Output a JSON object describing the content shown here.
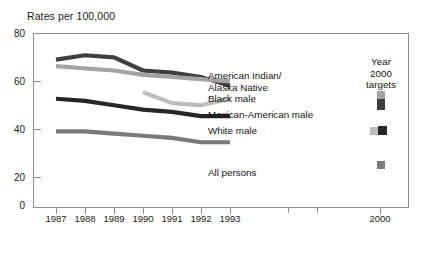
{
  "chart_data": {
    "type": "line",
    "title": "Rates per 100,000",
    "xlabel": "",
    "ylabel": "Rates per 100,000",
    "ylim": [
      0,
      80
    ],
    "yticks": [
      0,
      20,
      40,
      60,
      80
    ],
    "ytick_labels": [
      "0",
      "20",
      "40",
      "60",
      "80"
    ],
    "grid": false,
    "legend_position": "inline-right",
    "x": [
      "1987",
      "1988",
      "1989",
      "1990",
      "1991",
      "1992",
      "1993"
    ],
    "xtick_labels": [
      "1987",
      "1988",
      "1989",
      "1990",
      "1991",
      "1992",
      "1993"
    ],
    "extra_xtick": "2000",
    "series": [
      {
        "name": "American Indian/\nAlaska Native",
        "label_line1": "American Indian/",
        "label_line2": "Alaska Native",
        "color": "#3f3f3f",
        "x": [
          "1987",
          "1988",
          "1989",
          "1990",
          "1991",
          "1992",
          "1993"
        ],
        "values": [
          68,
          70,
          69,
          63,
          62,
          60,
          56
        ],
        "target_2000": 60
      },
      {
        "name": "Black male",
        "label_line1": "Black male",
        "color": "#a3a3a3",
        "x": [
          "1987",
          "1988",
          "1989",
          "1990",
          "1991",
          "1992",
          "1993"
        ],
        "values": [
          65,
          64,
          63,
          61,
          60,
          59,
          58
        ],
        "target_2000": 63
      },
      {
        "name": "Mexican-American male",
        "label_line1": "Mexican-American male",
        "color": "#bdbdbd",
        "x": [
          "1990",
          "1991",
          "1992",
          "1993"
        ],
        "values": [
          53,
          48,
          47,
          50
        ],
        "target_2000": 47
      },
      {
        "name": "White male",
        "label_line1": "White male",
        "color": "#262626",
        "x": [
          "1987",
          "1988",
          "1989",
          "1990",
          "1991",
          "1992",
          "1993"
        ],
        "values": [
          50,
          49,
          47,
          45,
          44,
          42,
          42
        ],
        "target_2000": 47
      },
      {
        "name": "All persons",
        "label_line1": "All persons",
        "color": "#7a7a7a",
        "x": [
          "1987",
          "1988",
          "1989",
          "1990",
          "1991",
          "1992",
          "1993"
        ],
        "values": [
          35,
          35,
          34,
          33,
          32,
          30,
          30
        ],
        "target_2000": 29
      }
    ],
    "targets_legend": {
      "line1": "Year",
      "line2": "2000",
      "line3": "targets"
    }
  }
}
